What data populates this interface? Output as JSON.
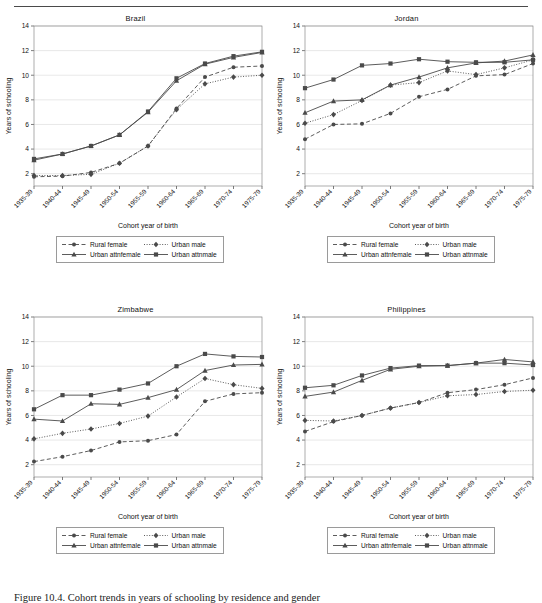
{
  "figure": {
    "caption": "Figure 10.4. Cohort trends in years of schooling by residence and gender",
    "axis_x_label": "Cohort year of birth",
    "axis_y_label": "Years of schooling"
  },
  "legend": {
    "items": [
      {
        "label": "Rural female",
        "key": "rural_female",
        "marker": "circle",
        "dash": "dashed"
      },
      {
        "label": "Urban male",
        "key": "urban_male",
        "marker": "diamond",
        "dash": "dotted"
      },
      {
        "label": "Urban attnfemale",
        "key": "urban_attnfemale",
        "marker": "triangle",
        "dash": "solid"
      },
      {
        "label": "Urban attnmale",
        "key": "urban_attnmale",
        "marker": "square",
        "dash": "solid"
      }
    ]
  },
  "chart_data": [
    {
      "type": "line",
      "title": "Brazil",
      "xlabel": "Cohort year of birth",
      "ylabel": "Years of schooling",
      "categories": [
        "1935-39",
        "1940-44",
        "1945-49",
        "1950-54",
        "1955-59",
        "1960-64",
        "1965-69",
        "1970-74",
        "1975-79"
      ],
      "ylim": [
        1,
        14
      ],
      "yticks": [
        2,
        4,
        6,
        8,
        10,
        12,
        14
      ],
      "grid": true,
      "legend_position": "below",
      "series": [
        {
          "name": "Rural female",
          "values": [
            1.75,
            1.8,
            2.1,
            2.85,
            4.25,
            7.3,
            9.85,
            10.65,
            10.75
          ]
        },
        {
          "name": "Urban male",
          "values": [
            1.85,
            1.85,
            1.95,
            2.85,
            4.25,
            7.2,
            9.3,
            9.85,
            10.0
          ]
        },
        {
          "name": "Urban attnfemale",
          "values": [
            3.1,
            3.6,
            4.25,
            5.15,
            7.0,
            9.55,
            10.9,
            11.45,
            11.85
          ]
        },
        {
          "name": "Urban attnmale",
          "values": [
            3.2,
            3.6,
            4.25,
            5.15,
            7.05,
            9.75,
            10.95,
            11.55,
            11.9
          ]
        }
      ]
    },
    {
      "type": "line",
      "title": "Jordan",
      "xlabel": "Cohort year of birth",
      "ylabel": "Years of schooling",
      "categories": [
        "1935-39",
        "1940-44",
        "1945-49",
        "1950-54",
        "1955-59",
        "1960-64",
        "1965-69",
        "1970-74",
        "1975-79"
      ],
      "ylim": [
        1,
        14
      ],
      "yticks": [
        2,
        4,
        6,
        8,
        10,
        12,
        14
      ],
      "grid": true,
      "legend_position": "below",
      "series": [
        {
          "name": "Rural female",
          "values": [
            4.8,
            6.0,
            6.05,
            6.9,
            8.25,
            8.85,
            9.95,
            10.05,
            10.95
          ]
        },
        {
          "name": "Urban male",
          "values": [
            6.1,
            6.8,
            7.95,
            9.2,
            9.4,
            10.35,
            10.05,
            10.6,
            11.25
          ]
        },
        {
          "name": "Urban attnfemale",
          "values": [
            6.95,
            7.9,
            8.0,
            9.2,
            9.85,
            10.6,
            11.0,
            11.15,
            11.65
          ]
        },
        {
          "name": "Urban attnmale",
          "values": [
            8.95,
            9.65,
            10.8,
            10.95,
            11.3,
            11.1,
            11.05,
            11.05,
            11.25
          ]
        }
      ]
    },
    {
      "type": "line",
      "title": "Zimbabwe",
      "xlabel": "Cohort year of birth",
      "ylabel": "Years of schooling",
      "categories": [
        "1935-39",
        "1940-44",
        "1945-49",
        "1950-54",
        "1955-59",
        "1960-64",
        "1965-69",
        "1970-74",
        "1975-79"
      ],
      "ylim": [
        1,
        14
      ],
      "yticks": [
        2,
        4,
        6,
        8,
        10,
        12,
        14
      ],
      "grid": true,
      "legend_position": "below",
      "series": [
        {
          "name": "Rural female",
          "values": [
            2.25,
            2.65,
            3.15,
            3.85,
            3.95,
            4.45,
            7.15,
            7.75,
            7.85
          ]
        },
        {
          "name": "Urban male",
          "values": [
            4.1,
            4.55,
            4.9,
            5.35,
            5.95,
            7.5,
            9.0,
            8.5,
            8.2
          ]
        },
        {
          "name": "Urban attnfemale",
          "values": [
            5.7,
            5.55,
            6.95,
            6.9,
            7.45,
            8.1,
            9.65,
            10.1,
            10.15
          ]
        },
        {
          "name": "Urban attnmale",
          "values": [
            6.5,
            7.65,
            7.65,
            8.1,
            8.6,
            10.0,
            11.0,
            10.8,
            10.75
          ]
        }
      ]
    },
    {
      "type": "line",
      "title": "Philippines",
      "xlabel": "Cohort year of birth",
      "ylabel": "Years of schooling",
      "categories": [
        "1935-39",
        "1940-44",
        "1945-49",
        "1950-54",
        "1955-59",
        "1960-64",
        "1965-69",
        "1970-74",
        "1975-79"
      ],
      "ylim": [
        1,
        14
      ],
      "yticks": [
        2,
        4,
        6,
        8,
        10,
        12,
        14
      ],
      "grid": true,
      "legend_position": "below",
      "series": [
        {
          "name": "Rural female",
          "values": [
            4.7,
            5.5,
            6.0,
            6.6,
            7.05,
            7.85,
            8.1,
            8.5,
            9.05
          ]
        },
        {
          "name": "Urban male",
          "values": [
            5.6,
            5.55,
            6.0,
            6.6,
            7.05,
            7.6,
            7.7,
            7.95,
            8.05
          ]
        },
        {
          "name": "Urban attnfemale",
          "values": [
            7.55,
            7.9,
            8.85,
            9.75,
            10.0,
            10.05,
            10.25,
            10.55,
            10.35
          ]
        },
        {
          "name": "Urban attnmale",
          "values": [
            8.25,
            8.45,
            9.25,
            9.85,
            10.05,
            10.05,
            10.25,
            10.25,
            10.1
          ]
        }
      ]
    }
  ]
}
